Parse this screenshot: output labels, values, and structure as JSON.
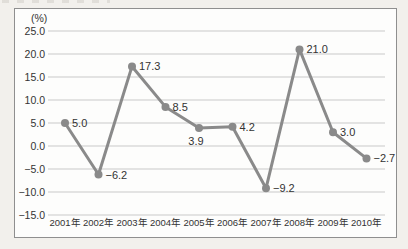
{
  "page": {
    "background": "#f2f0ec"
  },
  "chart_data": {
    "type": "line",
    "title": "",
    "unit_label": "(%)",
    "categories": [
      "2001年",
      "2002年",
      "2003年",
      "2004年",
      "2005年",
      "2006年",
      "2007年",
      "2008年",
      "2009年",
      "2010年"
    ],
    "values": [
      5.0,
      -6.2,
      17.3,
      8.5,
      3.9,
      4.2,
      -9.2,
      21.0,
      3.0,
      -2.7
    ],
    "labels": [
      "5.0",
      "−6.2",
      "17.3",
      "8.5",
      "3.9",
      "4.2",
      "−9.2",
      "21.0",
      "3.0",
      "−2.7"
    ],
    "label_positions": [
      "right",
      "right",
      "right",
      "right",
      "below",
      "right",
      "right",
      "right",
      "right",
      "right"
    ],
    "y_ticks": [
      25.0,
      20.0,
      15.0,
      10.0,
      5.0,
      0.0,
      -5.0,
      -10.0,
      -15.0
    ],
    "y_tick_labels": [
      "25.0",
      "20.0",
      "15.0",
      "10.0",
      "5.0",
      "0.0",
      "−5.0",
      "−10.0",
      "−15.0"
    ],
    "ylim": [
      -15.0,
      25.0
    ],
    "xlabel": "",
    "ylabel": "(%)",
    "grid": true,
    "legend": "none",
    "colors": {
      "page_background": "#f2f0ec",
      "plot_background": "#fdfdfc",
      "box_border": "#8f8f8f",
      "grid": "#c9c9c9",
      "line": "#8a8a8a",
      "marker": "#8a8a8a",
      "text": "#333333"
    }
  }
}
